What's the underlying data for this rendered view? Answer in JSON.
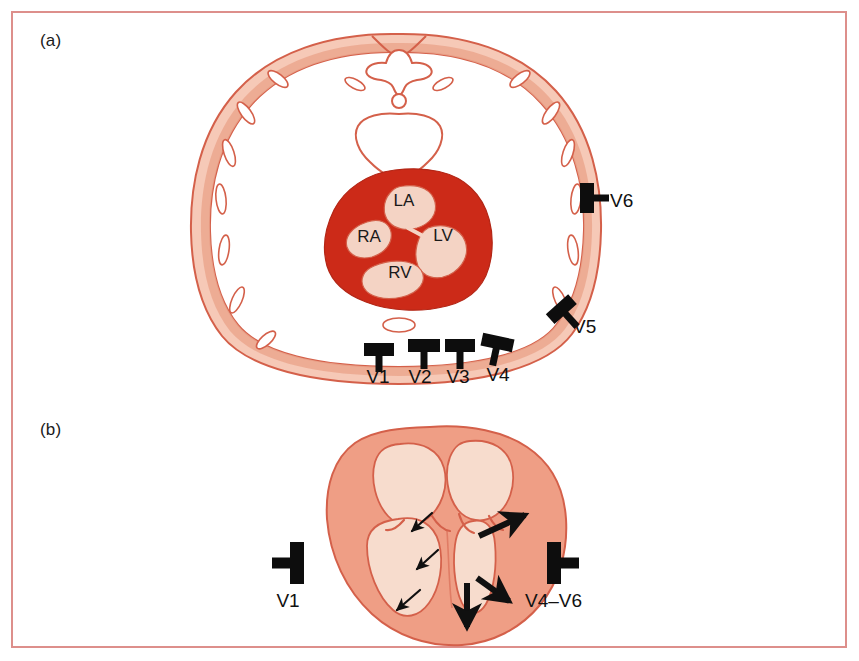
{
  "figure": {
    "border_color": "#dd8f8b",
    "background": "#ffffff"
  },
  "panels": [
    {
      "id": "a",
      "label": "(a)"
    },
    {
      "id": "b",
      "label": "(b)"
    }
  ],
  "panel_a": {
    "title_label": "(a)",
    "description": "Transverse thoracic cross-section showing heart position and chest electrode placement",
    "colors": {
      "chest_wall_outer": "#f4c3b0",
      "chest_wall_inner": "#eca88f",
      "outline": "#d4604a",
      "rib": "#ffffff",
      "myocardium": "#cc2a18",
      "chamber_cavity": "#f4d3c4",
      "electrode": "#0d0d0d"
    },
    "chambers": [
      {
        "id": "ra",
        "label": "RA",
        "x": 369,
        "y": 242
      },
      {
        "id": "la",
        "label": "LA",
        "x": 404,
        "y": 206
      },
      {
        "id": "lv",
        "label": "LV",
        "x": 440,
        "y": 241
      },
      {
        "id": "rv",
        "label": "RV",
        "x": 400,
        "y": 278
      }
    ],
    "electrodes": [
      {
        "id": "v1",
        "label": "V1",
        "label_x": 378,
        "label_y": 383,
        "pad_x": 379,
        "pad_y": 352,
        "rotation": 0
      },
      {
        "id": "v2",
        "label": "V2",
        "label_x": 420,
        "label_y": 383,
        "pad_x": 424,
        "pad_y": 348,
        "rotation": 0
      },
      {
        "id": "v3",
        "label": "V3",
        "label_x": 458,
        "label_y": 383,
        "pad_x": 460,
        "pad_y": 348,
        "rotation": 0
      },
      {
        "id": "v4",
        "label": "V4",
        "label_x": 496,
        "label_y": 381,
        "pad_x": 497,
        "pad_y": 345,
        "rotation": 0
      },
      {
        "id": "v5",
        "label": "V5",
        "label_x": 573,
        "label_y": 331,
        "pad_x": 563,
        "pad_y": 311,
        "rotation": 45
      },
      {
        "id": "v6",
        "label": "V6",
        "label_x": 609,
        "label_y": 207,
        "pad_x": 592,
        "pad_y": 198,
        "rotation": 90
      }
    ]
  },
  "panel_b": {
    "title_label": "(b)",
    "description": "Coronal four-chamber heart section with septal and left ventricular depolarization vectors",
    "colors": {
      "myocardium": "#ef9e85",
      "chamber_cavity": "#f7dccd",
      "outline": "#d4604a",
      "arrow": "#101010",
      "electrode": "#0d0d0d"
    },
    "electrodes": [
      {
        "id": "v1",
        "label": "V1",
        "label_x": 283,
        "label_y": 606,
        "pad_x": 292,
        "pad_y": 563,
        "direction": "left"
      },
      {
        "id": "v4v6",
        "label": "V4–V6",
        "label_x": 556,
        "label_y": 606,
        "pad_x": 559,
        "pad_y": 563,
        "direction": "right"
      }
    ],
    "vectors": [
      {
        "id": "septal-1",
        "weight": "thin",
        "description": "septal depolarization, leftward-down"
      },
      {
        "id": "septal-2",
        "weight": "thin",
        "description": "septal depolarization, leftward-down"
      },
      {
        "id": "septal-3",
        "weight": "thin",
        "description": "apical septal depolarization, leftward-down"
      },
      {
        "id": "lv-free-wall-1",
        "weight": "thick",
        "description": "left ventricular free wall, rightward-up"
      },
      {
        "id": "lv-free-wall-2",
        "weight": "thick",
        "description": "left ventricular free wall, rightward-down"
      },
      {
        "id": "lv-apex",
        "weight": "thick",
        "description": "left ventricular apex, downward"
      }
    ]
  }
}
